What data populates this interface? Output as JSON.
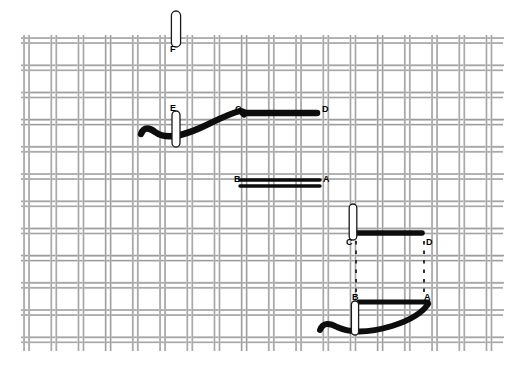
{
  "figure": {
    "background_color": "#ffffff",
    "thread_color": "#0d0d0d",
    "canvas_thread_color": "#9a9a9a",
    "canvas_shadow_color": "#c8c8c8",
    "needle_outline_color": "#1a1a1a",
    "needle_fill_color": "#ffffff",
    "dashed_line_color": "#2a2a2a"
  },
  "canvas_fabric": {
    "name": "aida-canvas",
    "left": 24,
    "top": 38,
    "right": 500,
    "bottom": 348,
    "cell_size": 27.2,
    "pair_gap": 5.0,
    "thread_width": 2.0
  },
  "point_labels": [
    {
      "id": "F",
      "text": "F",
      "x": 170,
      "y": 45
    },
    {
      "id": "E",
      "text": "E",
      "x": 170,
      "y": 104
    },
    {
      "id": "C_top",
      "text": "C",
      "x": 235,
      "y": 105
    },
    {
      "id": "D_top",
      "text": "D",
      "x": 322,
      "y": 105
    },
    {
      "id": "B_mid",
      "text": "B",
      "x": 234,
      "y": 175
    },
    {
      "id": "A_mid",
      "text": "A",
      "x": 323,
      "y": 175
    },
    {
      "id": "C_low",
      "text": "C",
      "x": 346,
      "y": 238
    },
    {
      "id": "D_low",
      "text": "D",
      "x": 426,
      "y": 238
    },
    {
      "id": "B_low",
      "text": "B",
      "x": 352,
      "y": 293
    },
    {
      "id": "A_low",
      "text": "A",
      "x": 424,
      "y": 293
    }
  ],
  "stitches": [
    {
      "name": "stitch-bar-CD-top",
      "from": "C",
      "to": "D",
      "x1": 243,
      "y1": 113,
      "x2": 317,
      "y2": 113,
      "width": 6.5,
      "style": "single"
    },
    {
      "name": "stitch-bar-BA-upper",
      "from": "B",
      "to": "A",
      "x1": 240,
      "y1": 180,
      "x2": 320,
      "y2": 180,
      "width": 3.4,
      "style": "double-upper"
    },
    {
      "name": "stitch-bar-BA-lower",
      "from": "B",
      "to": "A",
      "x1": 240,
      "y1": 186,
      "x2": 320,
      "y2": 186,
      "width": 3.4,
      "style": "double-lower"
    },
    {
      "name": "stitch-bar-CD-low",
      "from": "C",
      "to": "D",
      "x1": 355,
      "y1": 233,
      "x2": 422,
      "y2": 233,
      "width": 5.6,
      "style": "single"
    },
    {
      "name": "stitch-bar-BA-low",
      "from": "B",
      "to": "A",
      "x1": 359,
      "y1": 302,
      "x2": 428,
      "y2": 302,
      "width": 5.2,
      "style": "single"
    }
  ],
  "threads": [
    {
      "name": "thread-curve-to-C",
      "description": "curved working thread rising from lower left into point C"
    },
    {
      "name": "thread-curve-to-A",
      "description": "curved working thread rising from lower left into point A"
    }
  ],
  "guide_lines": [
    {
      "name": "dashed-guide-C-to-B",
      "x": 356,
      "y1": 241,
      "y2": 294
    },
    {
      "name": "dashed-guide-D-to-A",
      "x": 424,
      "y1": 241,
      "y2": 294
    }
  ],
  "needles": [
    {
      "name": "needle-F",
      "cx": 176,
      "cy": 29,
      "rx": 4.6,
      "ry": 18
    },
    {
      "name": "needle-E",
      "cx": 176,
      "cy": 129,
      "rx": 4.0,
      "ry": 18
    },
    {
      "name": "needle-C-low",
      "cx": 353,
      "cy": 222,
      "rx": 3.8,
      "ry": 18
    },
    {
      "name": "needle-B-low",
      "cx": 355,
      "cy": 318,
      "rx": 3.6,
      "ry": 17
    }
  ]
}
